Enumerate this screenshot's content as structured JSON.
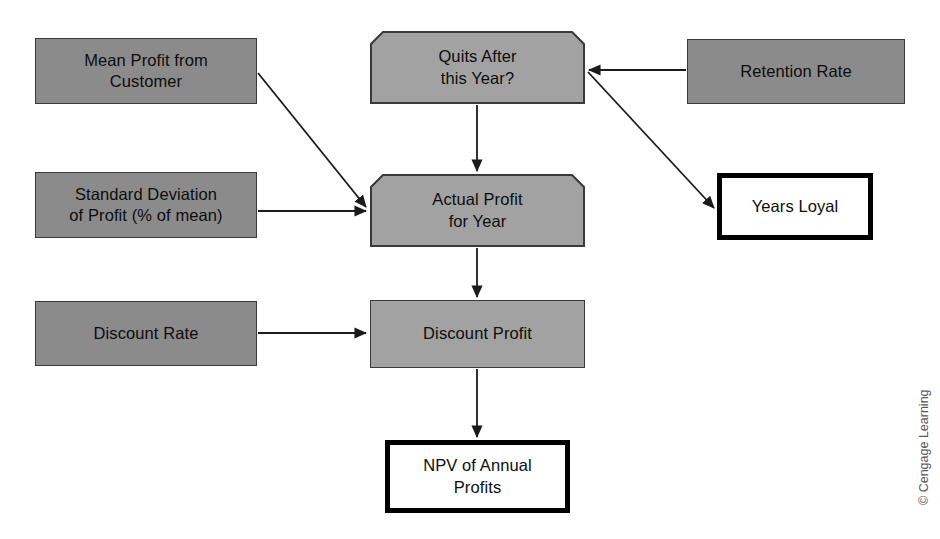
{
  "diagram": {
    "background_color": "#ffffff",
    "colors": {
      "input_fill": "#8b8b8b",
      "process_fill": "#a2a2a2",
      "output_fill": "#ffffff",
      "output_border": "#000000",
      "node_border": "#3a3a3a",
      "edge_color": "#1a1a1a",
      "text_color": "#0d0d0d",
      "credit_color": "#56585a"
    },
    "nodes": [
      {
        "id": "mean-profit-from-customer",
        "label": "Mean Profit from\nCustomer",
        "kind": "input",
        "x": 35,
        "y": 38,
        "w": 222,
        "h": 66
      },
      {
        "id": "quits-after-this-year",
        "label": "Quits After\nthis Year?",
        "kind": "process",
        "shape": "chamfer-top",
        "x": 370,
        "y": 31,
        "w": 215,
        "h": 73
      },
      {
        "id": "retention-rate",
        "label": "Retention Rate",
        "kind": "input",
        "x": 687,
        "y": 39,
        "w": 218,
        "h": 65
      },
      {
        "id": "standard-deviation-of-profit",
        "label": "Standard Deviation\nof Profit (% of mean)",
        "kind": "input",
        "x": 35,
        "y": 172,
        "w": 222,
        "h": 66
      },
      {
        "id": "actual-profit-for-year",
        "label": "Actual Profit\nfor Year",
        "kind": "process",
        "shape": "chamfer-top",
        "x": 370,
        "y": 174,
        "w": 215,
        "h": 73
      },
      {
        "id": "years-loyal",
        "label": "Years Loyal",
        "kind": "output",
        "x": 717,
        "y": 173,
        "w": 156,
        "h": 67
      },
      {
        "id": "discount-rate",
        "label": "Discount Rate",
        "kind": "input",
        "x": 35,
        "y": 301,
        "w": 222,
        "h": 65
      },
      {
        "id": "discount-profit",
        "label": "Discount Profit",
        "kind": "process",
        "shape": "rect",
        "x": 370,
        "y": 300,
        "w": 215,
        "h": 68
      },
      {
        "id": "npv-of-annual-profits",
        "label": "NPV of Annual\nProfits",
        "kind": "output",
        "x": 385,
        "y": 440,
        "w": 185,
        "h": 73
      }
    ],
    "edges": [
      {
        "id": "mean-profit-to-actual-profit",
        "from": "mean-profit-from-customer",
        "to": "actual-profit-for-year",
        "style": "diagonal",
        "arrow": true
      },
      {
        "id": "std-deviation-to-actual-profit",
        "from": "standard-deviation-of-profit",
        "to": "actual-profit-for-year",
        "style": "horizontal",
        "arrow": true
      },
      {
        "id": "quits-to-actual-profit",
        "from": "quits-after-this-year",
        "to": "actual-profit-for-year",
        "style": "vertical",
        "arrow": true
      },
      {
        "id": "retention-rate-to-quits",
        "from": "retention-rate",
        "to": "quits-after-this-year",
        "style": "horizontal",
        "arrow": true
      },
      {
        "id": "quits-to-years-loyal",
        "from": "quits-after-this-year",
        "to": "years-loyal",
        "style": "diagonal",
        "arrow": true
      },
      {
        "id": "actual-profit-to-discount-profit",
        "from": "actual-profit-for-year",
        "to": "discount-profit",
        "style": "vertical",
        "arrow": true
      },
      {
        "id": "discount-rate-to-discount-profit",
        "from": "discount-rate",
        "to": "discount-profit",
        "style": "horizontal",
        "arrow": true
      },
      {
        "id": "discount-profit-to-npv",
        "from": "discount-profit",
        "to": "npv-of-annual-profits",
        "style": "vertical",
        "arrow": true
      }
    ],
    "credit": "© Cengage Learning"
  }
}
